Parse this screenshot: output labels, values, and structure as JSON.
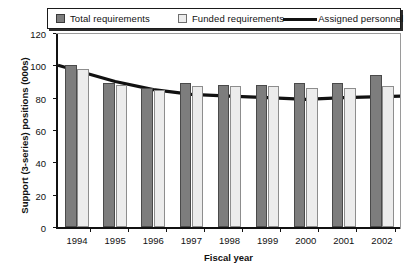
{
  "legend": {
    "items": [
      {
        "label": "Total requirements",
        "marker": "dark-square-swatch",
        "color": "#7d7d7d"
      },
      {
        "label": "Funded requirements",
        "marker": "light-square-swatch",
        "color": "#ececec"
      },
      {
        "label": "Assigned personnel",
        "marker": "line-swatch",
        "color": "#111111"
      }
    ]
  },
  "axes": {
    "y_title": "Support (3-series) positions (000s)",
    "x_title": "Fiscal year",
    "y_ticks": [
      "0",
      "20",
      "40",
      "60",
      "80",
      "100",
      "120"
    ],
    "x_ticks": [
      "1994",
      "1995",
      "1996",
      "1997",
      "1998",
      "1999",
      "2000",
      "2001",
      "2002"
    ]
  },
  "chart_data": {
    "type": "bar",
    "title": "",
    "xlabel": "Fiscal year",
    "ylabel": "Support (3-series) positions (000s)",
    "categories": [
      "1994",
      "1995",
      "1996",
      "1997",
      "1998",
      "1999",
      "2000",
      "2001",
      "2002"
    ],
    "ylim": [
      0,
      120
    ],
    "yticks": [
      0,
      20,
      40,
      60,
      80,
      100,
      120
    ],
    "grid": false,
    "legend_position": "top",
    "series": [
      {
        "name": "Total requirements",
        "type": "bar",
        "color": "#7d7d7d",
        "values": [
          100,
          89,
          86,
          89,
          88,
          88,
          89,
          89,
          94
        ]
      },
      {
        "name": "Funded requirements",
        "type": "bar",
        "color": "#ececec",
        "values": [
          98,
          88,
          85,
          87,
          87,
          87,
          86,
          86,
          87
        ]
      },
      {
        "name": "Assigned personnel",
        "type": "line",
        "color": "#111111",
        "values": [
          100,
          90,
          85,
          82,
          81,
          80,
          79,
          80,
          81
        ]
      }
    ]
  }
}
